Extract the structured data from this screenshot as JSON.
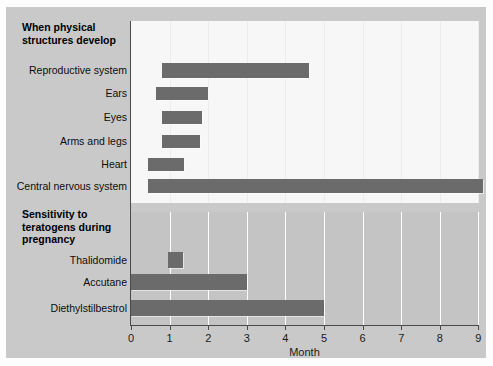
{
  "chart_data": {
    "type": "bar",
    "orientation": "horizontal",
    "title": "",
    "xlabel": "Month",
    "ylabel": "",
    "xlim": [
      0,
      9.6
    ],
    "xticks": [
      0,
      1,
      2,
      3,
      4,
      5,
      6,
      7,
      8,
      9
    ],
    "xticklabels": [
      "0",
      "1",
      "2",
      "3",
      "4",
      "5",
      "6",
      "7",
      "8",
      "9"
    ],
    "grid": true,
    "legend": null,
    "bar_color": "#6b6b6b",
    "panels": [
      {
        "id": "structures",
        "heading": "When physical\nstructures develop",
        "heading_line1": "When physical",
        "heading_line2": "structures develop",
        "background": "#f7f7f7",
        "bars": [
          {
            "label": "Reproductive system",
            "start": 0.8,
            "end": 4.6
          },
          {
            "label": "Ears",
            "start": 0.66,
            "end": 2.0
          },
          {
            "label": "Eyes",
            "start": 0.8,
            "end": 1.85
          },
          {
            "label": "Arms and legs",
            "start": 0.8,
            "end": 1.8
          },
          {
            "label": "Heart",
            "start": 0.45,
            "end": 1.37
          },
          {
            "label": "Central nervous system",
            "start": 0.45,
            "end": 9.13
          }
        ]
      },
      {
        "id": "teratogens",
        "heading": "Sensitivity to teratogens during pregnancy",
        "heading_line1": "Sensitivity to",
        "heading_line2": "teratogens during",
        "heading_line3": "pregnancy",
        "background": "#c4c4c4",
        "bars": [
          {
            "label": "Thalidomide",
            "start": 0.95,
            "end": 1.35
          },
          {
            "label": "Accutane",
            "start": 0.0,
            "end": 3.0
          },
          {
            "label": "Diethylstilbestrol",
            "start": 0.0,
            "end": 5.0
          }
        ]
      }
    ]
  },
  "axis": {
    "x_title": "Month",
    "tick_0": "0",
    "tick_1": "1",
    "tick_2": "2",
    "tick_3": "3",
    "tick_4": "4",
    "tick_5": "5",
    "tick_6": "6",
    "tick_7": "7",
    "tick_8": "8",
    "tick_9": "9"
  },
  "headings": {
    "structures_l1": "When physical",
    "structures_l2": "structures develop",
    "sensitivity_l1": "Sensitivity to",
    "sensitivity_l2": "teratogens during",
    "sensitivity_l3": "pregnancy"
  },
  "row_labels": {
    "reproductive": "Reproductive system",
    "ears": "Ears",
    "eyes": "Eyes",
    "arms": "Arms and legs",
    "heart": "Heart",
    "cns": "Central nervous system",
    "thalidomide": "Thalidomide",
    "accutane": "Accutane",
    "des": "Diethylstilbestrol"
  }
}
